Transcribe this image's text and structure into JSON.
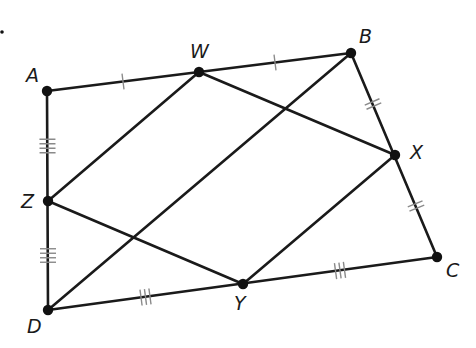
{
  "diagram": {
    "type": "geometry-quadrilateral-midpoints",
    "marker_dot": {
      "x": 2,
      "y": 32
    },
    "points": {
      "A": {
        "x": 47,
        "y": 91,
        "label_x": 26,
        "label_y": 82
      },
      "W": {
        "x": 199,
        "y": 72,
        "label_x": 190,
        "label_y": 58
      },
      "B": {
        "x": 351,
        "y": 53,
        "label_x": 359,
        "label_y": 43
      },
      "X": {
        "x": 395,
        "y": 155,
        "label_x": 410,
        "label_y": 159
      },
      "C": {
        "x": 437,
        "y": 257,
        "label_x": 446,
        "label_y": 277
      },
      "Y": {
        "x": 243,
        "y": 284,
        "label_x": 234,
        "label_y": 310
      },
      "D": {
        "x": 48,
        "y": 310,
        "label_x": 27,
        "label_y": 333
      },
      "Z": {
        "x": 48,
        "y": 201,
        "label_x": 21,
        "label_y": 208
      }
    },
    "labels": {
      "A": "A",
      "W": "W",
      "B": "B",
      "X": "X",
      "C": "C",
      "Y": "Y",
      "D": "D",
      "Z": "Z"
    },
    "segments": [
      [
        "A",
        "B"
      ],
      [
        "B",
        "C"
      ],
      [
        "C",
        "D"
      ],
      [
        "D",
        "A"
      ],
      [
        "W",
        "X"
      ],
      [
        "X",
        "Y"
      ],
      [
        "Y",
        "Z"
      ],
      [
        "Z",
        "W"
      ],
      [
        "B",
        "D"
      ]
    ],
    "congruence_marks": [
      {
        "segment": [
          "A",
          "W"
        ],
        "ticks": 1
      },
      {
        "segment": [
          "W",
          "B"
        ],
        "ticks": 1
      },
      {
        "segment": [
          "B",
          "X"
        ],
        "ticks": 2
      },
      {
        "segment": [
          "X",
          "C"
        ],
        "ticks": 2
      },
      {
        "segment": [
          "C",
          "Y"
        ],
        "ticks": 3
      },
      {
        "segment": [
          "Y",
          "D"
        ],
        "ticks": 3
      },
      {
        "segment": [
          "D",
          "Z"
        ],
        "ticks": 4
      },
      {
        "segment": [
          "Z",
          "A"
        ],
        "ticks": 4
      }
    ]
  }
}
